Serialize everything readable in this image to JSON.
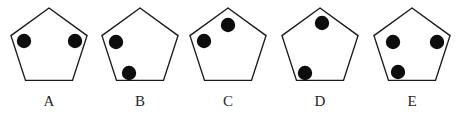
{
  "panel": {
    "background_color": "#ffffff",
    "width": 462,
    "height": 118,
    "description": "Row of five pentagon outlines, each containing black filled dots placed at or near pentagon vertices, labelled A through E."
  },
  "style": {
    "outline_color": "#1a1a1a",
    "outline_width": 1.4,
    "dot_color": "#0d0d0d",
    "dot_radius": 7.2,
    "label_color": "#262626",
    "label_font_size": 15,
    "label_baseline_y": 106
  },
  "figures": [
    {
      "id": "A",
      "label": "A",
      "center_x": 49,
      "center_y": 48,
      "radius": 40,
      "apex_y": 8,
      "label_x": 49,
      "dot_count": 2,
      "dots": [
        {
          "name": "upper-left-dot",
          "cx": 24,
          "cy": 41
        },
        {
          "name": "upper-right-dot",
          "cx": 75,
          "cy": 41
        }
      ]
    },
    {
      "id": "B",
      "label": "B",
      "center_x": 140,
      "center_y": 48,
      "radius": 40,
      "apex_y": 8,
      "label_x": 140,
      "dot_count": 2,
      "dots": [
        {
          "name": "upper-left-dot",
          "cx": 116,
          "cy": 42
        },
        {
          "name": "lower-left-dot",
          "cx": 129,
          "cy": 73
        }
      ]
    },
    {
      "id": "C",
      "label": "C",
      "center_x": 228,
      "center_y": 48,
      "radius": 40,
      "apex_y": 8,
      "label_x": 228,
      "dot_count": 2,
      "dots": [
        {
          "name": "upper-left-dot",
          "cx": 204,
          "cy": 41
        },
        {
          "name": "top-apex-dot",
          "cx": 228,
          "cy": 25
        }
      ]
    },
    {
      "id": "D",
      "label": "D",
      "center_x": 320,
      "center_y": 48,
      "radius": 40,
      "apex_y": 8,
      "label_x": 320,
      "dot_count": 2,
      "dots": [
        {
          "name": "top-apex-dot",
          "cx": 322,
          "cy": 23
        },
        {
          "name": "lower-left-dot",
          "cx": 305,
          "cy": 73
        }
      ]
    },
    {
      "id": "E",
      "label": "E",
      "center_x": 412,
      "center_y": 48,
      "radius": 40,
      "apex_y": 8,
      "label_x": 412,
      "dot_count": 3,
      "dots": [
        {
          "name": "upper-left-dot",
          "cx": 393,
          "cy": 42
        },
        {
          "name": "upper-right-dot",
          "cx": 437,
          "cy": 42
        },
        {
          "name": "lower-left-dot",
          "cx": 398,
          "cy": 72
        }
      ]
    }
  ]
}
